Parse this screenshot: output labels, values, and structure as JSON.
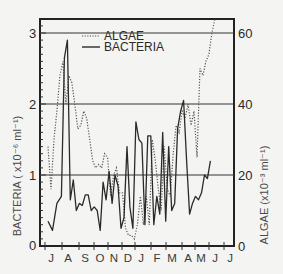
{
  "chart_data": {
    "type": "line",
    "title": "",
    "xlabel": "",
    "ylabel": "BACTERIA (x10^-6 ml^-1)",
    "y2label": "ALGAE (x10^-3 ml^-1)",
    "x_tick_labels": [
      "J",
      "A",
      "S",
      "O",
      "N",
      "D",
      "J",
      "F",
      "M",
      "A",
      "M",
      "J",
      "J"
    ],
    "y_ticks": [
      0,
      1,
      2,
      3
    ],
    "y2_ticks": [
      0,
      20,
      40,
      60
    ],
    "ylim": [
      0,
      3.2
    ],
    "y2lim": [
      0,
      64
    ],
    "grid": "horizontal lines at y=1, 2, 3",
    "legend": {
      "position": "upper left inside",
      "entries": [
        "ALGAE",
        "BACTERIA"
      ]
    },
    "x_domain_months": [
      0,
      12.7
    ],
    "series": [
      {
        "name": "BACTERIA",
        "axis": "left",
        "style": "solid",
        "x": [
          0.0,
          0.3,
          0.6,
          0.9,
          1.1,
          1.3,
          1.5,
          1.7,
          1.9,
          2.1,
          2.3,
          2.5,
          2.7,
          2.9,
          3.1,
          3.3,
          3.5,
          3.7,
          3.9,
          4.1,
          4.3,
          4.5,
          4.7,
          4.9,
          5.1,
          5.3,
          5.5,
          5.7,
          5.9,
          6.1,
          6.3,
          6.5,
          6.7,
          6.9,
          7.1,
          7.3,
          7.5,
          7.7,
          7.9,
          8.1,
          8.3,
          8.5,
          8.7,
          8.9,
          9.1,
          9.3,
          9.5,
          9.7,
          9.9,
          10.1,
          10.3,
          10.5,
          10.7,
          10.9,
          11.1,
          11.3,
          11.5,
          11.7,
          11.9,
          12.1
        ],
        "values": [
          0.35,
          0.22,
          0.6,
          0.7,
          2.65,
          2.9,
          0.65,
          0.93,
          0.5,
          0.6,
          0.57,
          0.72,
          0.72,
          0.5,
          0.55,
          0.5,
          0.22,
          0.9,
          0.65,
          1.05,
          0.6,
          1.0,
          0.85,
          0.25,
          0.4,
          1.4,
          0.55,
          0.25,
          1.75,
          1.5,
          1.45,
          0.3,
          1.55,
          1.55,
          0.3,
          0.7,
          0.45,
          1.6,
          0.35,
          1.4,
          0.5,
          0.6,
          1.65,
          1.9,
          2.05,
          1.2,
          0.45,
          0.6,
          0.7,
          0.65,
          0.75,
          1.0,
          0.95,
          1.2,
          null,
          null,
          null,
          null,
          null,
          null
        ]
      },
      {
        "name": "ALGAE",
        "axis": "right",
        "style": "dotted",
        "x": [
          0.0,
          0.2,
          0.4,
          0.6,
          0.8,
          1.0,
          1.2,
          1.4,
          1.6,
          1.8,
          2.0,
          2.2,
          2.4,
          2.6,
          2.8,
          3.0,
          3.2,
          3.4,
          3.6,
          3.8,
          4.0,
          4.2,
          4.4,
          4.6,
          4.8,
          5.0,
          5.2,
          5.4,
          5.6,
          5.8,
          6.0,
          6.2,
          6.4,
          6.6,
          6.8,
          7.0,
          7.2,
          7.4,
          7.6,
          7.8,
          8.0,
          8.2,
          8.4,
          8.6,
          8.8,
          9.0,
          9.2,
          9.4,
          9.6,
          9.8,
          10.0,
          10.2,
          10.4,
          10.6,
          10.8,
          11.0,
          11.2,
          11.4,
          11.6,
          11.8,
          12.0
        ],
        "values": [
          28,
          16,
          30,
          38,
          48,
          52,
          40,
          48,
          46,
          40,
          33,
          34,
          38,
          36,
          30,
          24,
          22,
          23,
          22,
          26,
          25,
          14,
          20,
          22,
          15,
          15,
          5,
          3,
          3,
          2,
          6,
          14,
          6,
          14,
          6,
          30,
          24,
          16,
          10,
          28,
          16,
          14,
          26,
          34,
          32,
          38,
          36,
          40,
          34,
          38,
          25,
          50,
          48,
          52,
          54,
          60,
          64,
          null,
          null,
          null,
          null
        ]
      }
    ]
  },
  "axes": {
    "left_tick_labels": [
      "0",
      "1",
      "2",
      "3"
    ],
    "right_tick_labels": [
      "0",
      "20",
      "40",
      "60"
    ],
    "left_title": "BACTERIA ( x10⁻⁶ ml⁻¹)",
    "right_title": "ALGAE (x10⁻³ ml⁻¹)",
    "months": [
      "J",
      "A",
      "S",
      "O",
      "N",
      "D",
      "J",
      "F",
      "M",
      "A",
      "M",
      "J",
      "J"
    ]
  },
  "legend": {
    "algae_label": "ALGAE",
    "bacteria_label": "BACTERIA"
  }
}
